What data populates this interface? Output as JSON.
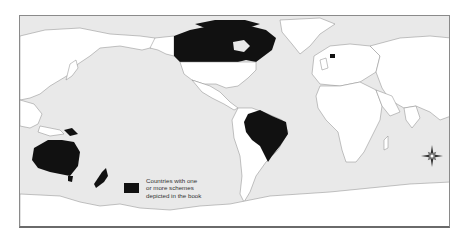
{
  "map": {
    "projection": "world, Pacific-centred",
    "ocean_color": "#e9e9e9",
    "land_color": "#ffffff",
    "highlight_color": "#111111",
    "highlighted_countries": [
      "Canada",
      "Netherlands",
      "Brazil",
      "Australia",
      "New Zealand",
      "Papua New Guinea"
    ]
  },
  "legend": {
    "swatch_color": "#111111",
    "lines": [
      "Countries with one",
      "or more schemes",
      "depicted in the book"
    ]
  },
  "compass": {
    "icon": "compass-rose-icon"
  }
}
